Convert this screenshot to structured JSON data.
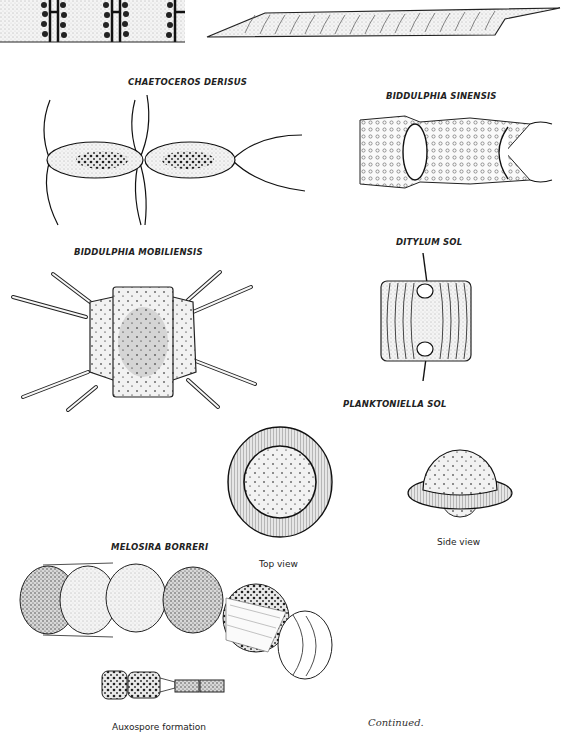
{
  "page": {
    "background": "#ffffff",
    "ink": "#1a1a1a",
    "footer_note": "Continued."
  },
  "specimens": [
    {
      "id": "top-chain",
      "label": ""
    },
    {
      "id": "top-elongate",
      "label": ""
    },
    {
      "id": "chaetoceros",
      "label": "CHAETOCEROS DERISUS"
    },
    {
      "id": "biddulphia-sinensis",
      "label": "BIDDULPHIA SINENSIS"
    },
    {
      "id": "biddulphia-mobiliensis",
      "label": "BIDDULPHIA MOBILIENSIS"
    },
    {
      "id": "ditylum",
      "label": "DITYLUM SOL"
    },
    {
      "id": "planktoniella",
      "label": "PLANKTONIELLA SOL",
      "views": [
        {
          "caption": "Top view"
        },
        {
          "caption": "Side view"
        }
      ]
    },
    {
      "id": "melosira",
      "label": "MELOSIRA BORRERI",
      "views": [
        {
          "caption": "Auxospore formation"
        }
      ]
    }
  ]
}
